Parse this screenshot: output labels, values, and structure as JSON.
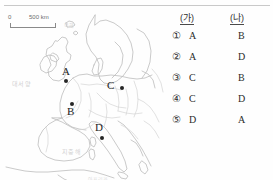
{
  "map": {
    "scale": {
      "zero_label": "0",
      "max_label": "500 km"
    },
    "sea_labels": {
      "atlantic": "대서양",
      "mediterranean": "지중해",
      "north_sea": "북해",
      "africa": "아프리카"
    },
    "points": [
      {
        "letter": "A",
        "dot_x": 64,
        "dot_y": 70,
        "label_x": 62,
        "label_y": 57
      },
      {
        "letter": "B",
        "dot_x": 70,
        "dot_y": 93,
        "label_x": 67,
        "label_y": 97
      },
      {
        "letter": "C",
        "dot_x": 120,
        "dot_y": 77,
        "label_x": 107,
        "label_y": 71
      },
      {
        "letter": "D",
        "dot_x": 100,
        "dot_y": 127,
        "label_x": 95,
        "label_y": 113
      }
    ]
  },
  "answer_table": {
    "columns": [
      "(가)",
      "(나)"
    ],
    "rows": [
      {
        "number": "①",
        "ga": "A",
        "na": "B"
      },
      {
        "number": "②",
        "ga": "A",
        "na": "D"
      },
      {
        "number": "③",
        "ga": "C",
        "na": "B"
      },
      {
        "number": "④",
        "ga": "C",
        "na": "D"
      },
      {
        "number": "⑤",
        "ga": "D",
        "na": "A"
      }
    ]
  },
  "colors": {
    "ink": "#2b2b2b",
    "coastline": "#b9b9b9",
    "border": "#cfcfcf",
    "rule": "#c9c9c9"
  }
}
